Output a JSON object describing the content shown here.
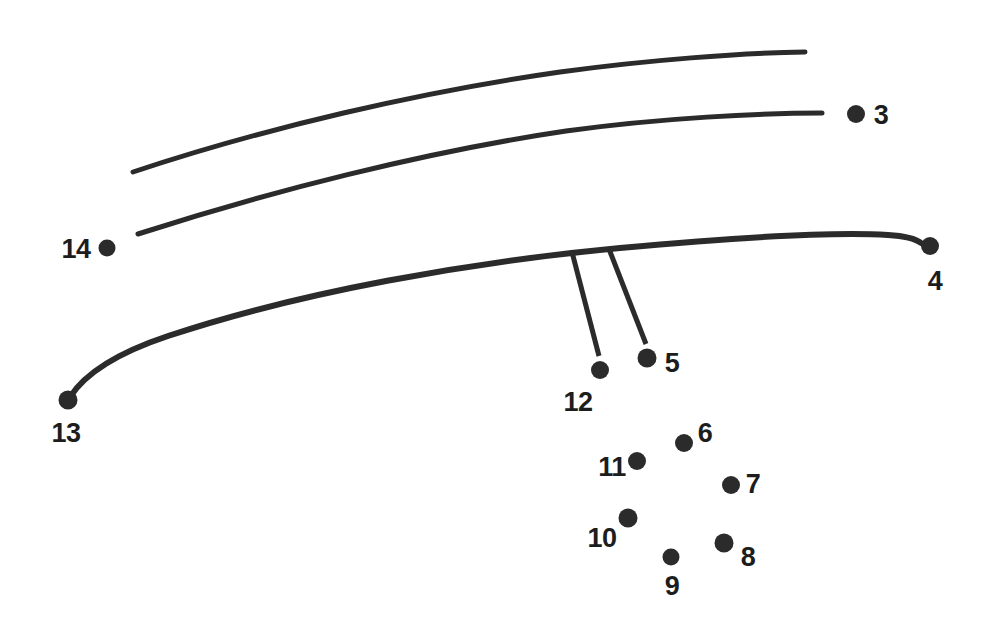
{
  "figure": {
    "background_color": "#ffffff",
    "ink_color": "#2b2b2b",
    "label_color": "#1d1d1d",
    "width": 998,
    "height": 640
  },
  "chart_data": {
    "type": "scatter",
    "title": "",
    "subtitle": "",
    "xlabel": "",
    "ylabel": "",
    "grid": false,
    "legend": "none",
    "xlim": [
      0,
      998
    ],
    "ylim": [
      640,
      0
    ],
    "point_labels": [
      "3",
      "4",
      "5",
      "6",
      "7",
      "8",
      "9",
      "10",
      "11",
      "12",
      "13",
      "14"
    ],
    "points": [
      {
        "label": "3",
        "x": 856,
        "y": 114,
        "radius": 9,
        "label_x": 881,
        "label_y": 115
      },
      {
        "label": "4",
        "x": 930,
        "y": 246,
        "radius": 9,
        "label_x": 935,
        "label_y": 281
      },
      {
        "label": "5",
        "x": 647,
        "y": 358,
        "radius": 9.5,
        "label_x": 672,
        "label_y": 363
      },
      {
        "label": "6",
        "x": 684,
        "y": 443,
        "radius": 9,
        "label_x": 705,
        "label_y": 433
      },
      {
        "label": "7",
        "x": 731,
        "y": 485,
        "radius": 9,
        "label_x": 753,
        "label_y": 484
      },
      {
        "label": "8",
        "x": 724,
        "y": 543,
        "radius": 9.5,
        "label_x": 748,
        "label_y": 557
      },
      {
        "label": "9",
        "x": 671,
        "y": 557,
        "radius": 8.5,
        "label_x": 672,
        "label_y": 586
      },
      {
        "label": "10",
        "x": 628,
        "y": 518,
        "radius": 9.5,
        "label_x": 602,
        "label_y": 538
      },
      {
        "label": "11",
        "x": 637,
        "y": 461,
        "radius": 9,
        "label_x": 612,
        "label_y": 467
      },
      {
        "label": "12",
        "x": 600,
        "y": 370,
        "radius": 9,
        "label_x": 578,
        "label_y": 402
      },
      {
        "label": "13",
        "x": 68,
        "y": 400,
        "radius": 9.5,
        "label_x": 66,
        "label_y": 433
      },
      {
        "label": "14",
        "x": 107,
        "y": 248,
        "radius": 8.5,
        "label_x": 76,
        "label_y": 249
      }
    ],
    "curves": [
      {
        "name": "upper-curve",
        "stroke_width": 5,
        "start": [
          133,
          172
        ],
        "end": [
          805,
          52
        ],
        "path": "M 133,172 C 265,128 420,92 560,72 C 648,60 740,53 805,52"
      },
      {
        "name": "middle-curve",
        "stroke_width": 5,
        "start": [
          138,
          234
        ],
        "end": [
          822,
          113
        ],
        "path": "M 138,234 C 268,192 424,152 566,131 C 660,118 762,113 822,113"
      },
      {
        "name": "lower-curve",
        "stroke_width": 6,
        "start": [
          70,
          397
        ],
        "end": [
          921,
          243
        ],
        "path": "M 70,397 C 86,372 120,352 168,336 C 300,292 470,262 620,248 C 740,237 838,232 888,235 C 906,236 916,239 921,243"
      }
    ],
    "leaders": [
      {
        "name": "leader-to-12",
        "stroke_width": 5,
        "from": [
          572,
          252
        ],
        "to": [
          599,
          356
        ]
      },
      {
        "name": "leader-to-5",
        "stroke_width": 5,
        "from": [
          609,
          249
        ],
        "to": [
          646,
          344
        ]
      }
    ]
  }
}
